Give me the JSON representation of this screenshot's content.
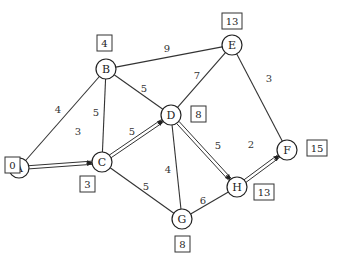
{
  "diagram": {
    "type": "weighted-graph-shortest-path",
    "nodes": [
      {
        "id": "A",
        "x": 19,
        "y": 168,
        "dist": "0",
        "box_x": 5,
        "box_y": 157
      },
      {
        "id": "B",
        "x": 106,
        "y": 69,
        "dist": "4",
        "box_x": 97,
        "box_y": 35
      },
      {
        "id": "C",
        "x": 102,
        "y": 162,
        "dist": "3",
        "box_x": 80,
        "box_y": 176
      },
      {
        "id": "D",
        "x": 171,
        "y": 115,
        "dist": "8",
        "box_x": 191,
        "box_y": 106
      },
      {
        "id": "E",
        "x": 232,
        "y": 45,
        "dist": "13",
        "box_x": 222,
        "box_y": 13
      },
      {
        "id": "F",
        "x": 287,
        "y": 150,
        "dist": "15",
        "box_x": 307,
        "box_y": 140
      },
      {
        "id": "G",
        "x": 182,
        "y": 219,
        "dist": "8",
        "box_x": 175,
        "box_y": 236
      },
      {
        "id": "H",
        "x": 237,
        "y": 187,
        "dist": "13",
        "box_x": 254,
        "box_y": 184
      }
    ],
    "edges": [
      {
        "from": "A",
        "to": "B",
        "weight": "4",
        "lx": 58,
        "ly": 109,
        "shortest": false
      },
      {
        "from": "A",
        "to": "C",
        "weight": "3",
        "lx": 78,
        "ly": 131,
        "shortest": true
      },
      {
        "from": "B",
        "to": "C",
        "weight": "5",
        "lx": 96,
        "ly": 112,
        "shortest": false
      },
      {
        "from": "B",
        "to": "D",
        "weight": "5",
        "lx": 144,
        "ly": 88,
        "shortest": false
      },
      {
        "from": "B",
        "to": "E",
        "weight": "9",
        "lx": 167,
        "ly": 48,
        "shortest": false
      },
      {
        "from": "C",
        "to": "D",
        "weight": "5",
        "lx": 132,
        "ly": 131,
        "shortest": true
      },
      {
        "from": "C",
        "to": "G",
        "weight": "5",
        "lx": 146,
        "ly": 186,
        "shortest": false
      },
      {
        "from": "D",
        "to": "E",
        "weight": "7",
        "lx": 197,
        "ly": 75,
        "shortest": false
      },
      {
        "from": "D",
        "to": "G",
        "weight": "4",
        "lx": 168,
        "ly": 169,
        "shortest": false
      },
      {
        "from": "D",
        "to": "H",
        "weight": "5",
        "lx": 218,
        "ly": 145,
        "shortest": true
      },
      {
        "from": "E",
        "to": "F",
        "weight": "3",
        "lx": 269,
        "ly": 78,
        "shortest": false
      },
      {
        "from": "G",
        "to": "H",
        "weight": "6",
        "lx": 203,
        "ly": 200,
        "shortest": false
      },
      {
        "from": "H",
        "to": "F",
        "weight": "2",
        "lx": 251,
        "ly": 144,
        "shortest": true
      }
    ]
  },
  "colors": {
    "stroke": "#333333",
    "background": "#ffffff"
  }
}
